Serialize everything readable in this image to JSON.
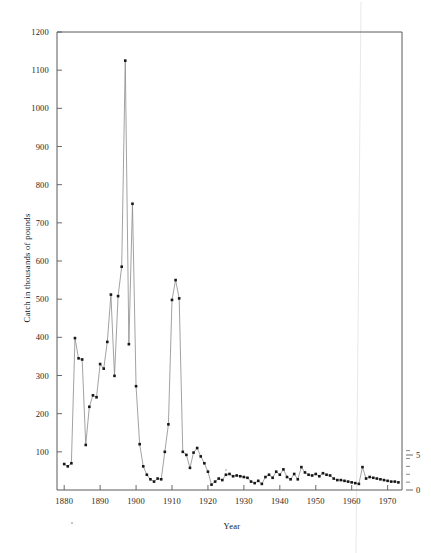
{
  "figure": {
    "background_color": "#ffffff",
    "line_color": "#8a8a8a",
    "point_color": "#171717",
    "axis_color": "#5a5a5a"
  },
  "chart_data": {
    "type": "line",
    "title": "",
    "subtitle": "",
    "xlabel": "Year",
    "ylabel": "Catch in thousands of pounds",
    "xlim": [
      1878,
      1974
    ],
    "ylim": [
      0,
      1200
    ],
    "grid": false,
    "legend": null,
    "x_ticks": [
      1880,
      1890,
      1900,
      1910,
      1920,
      1930,
      1940,
      1950,
      1960,
      1970
    ],
    "x_tick_labels": [
      "1880",
      "1890",
      "1900",
      "1910",
      "1920",
      "1930",
      "1940",
      "1950",
      "1960",
      "1970"
    ],
    "y_ticks": [
      100,
      200,
      300,
      400,
      500,
      600,
      700,
      800,
      900,
      1000,
      1100,
      1200
    ],
    "y_tick_labels": [
      "100",
      "200",
      "300",
      "400",
      "500",
      "600",
      "700",
      "800",
      "900",
      "1000",
      "1100",
      "1200"
    ],
    "secondary_axis": {
      "position": "right",
      "ticks": [
        0,
        5
      ],
      "tick_labels": [
        "0",
        "5"
      ],
      "minor_tick_count": 5,
      "label": ""
    },
    "series": [
      {
        "name": "Catch",
        "marker": "square",
        "x": [
          1880,
          1881,
          1882,
          1883,
          1884,
          1885,
          1886,
          1887,
          1888,
          1889,
          1890,
          1891,
          1892,
          1893,
          1894,
          1895,
          1896,
          1897,
          1898,
          1899,
          1900,
          1901,
          1902,
          1903,
          1904,
          1905,
          1906,
          1907,
          1908,
          1909,
          1910,
          1911,
          1912,
          1913,
          1914,
          1915,
          1916,
          1917,
          1918,
          1919,
          1920,
          1921,
          1922,
          1923,
          1924,
          1925,
          1926,
          1927,
          1928,
          1929,
          1930,
          1931,
          1932,
          1933,
          1934,
          1935,
          1936,
          1937,
          1938,
          1939,
          1940,
          1941,
          1942,
          1943,
          1944,
          1945,
          1946,
          1947,
          1948,
          1949,
          1950,
          1951,
          1952,
          1953,
          1954,
          1955,
          1956,
          1957,
          1958,
          1959,
          1960,
          1961,
          1962,
          1963,
          1964,
          1965,
          1966,
          1967,
          1968,
          1969,
          1970,
          1971,
          1972,
          1973
        ],
        "values": [
          68,
          62,
          70,
          398,
          345,
          342,
          118,
          218,
          248,
          243,
          330,
          318,
          388,
          512,
          299,
          508,
          585,
          1125,
          382,
          750,
          272,
          120,
          62,
          40,
          28,
          22,
          30,
          28,
          100,
          172,
          498,
          550,
          502,
          100,
          92,
          58,
          98,
          110,
          88,
          70,
          48,
          14,
          22,
          30,
          26,
          40,
          42,
          36,
          38,
          36,
          34,
          32,
          22,
          18,
          24,
          16,
          34,
          40,
          32,
          48,
          40,
          54,
          34,
          28,
          42,
          28,
          60,
          46,
          40,
          38,
          42,
          36,
          44,
          40,
          38,
          30,
          26,
          26,
          24,
          22,
          20,
          18,
          16,
          60,
          30,
          34,
          32,
          30,
          28,
          26,
          24,
          22,
          22,
          20
        ]
      }
    ]
  }
}
